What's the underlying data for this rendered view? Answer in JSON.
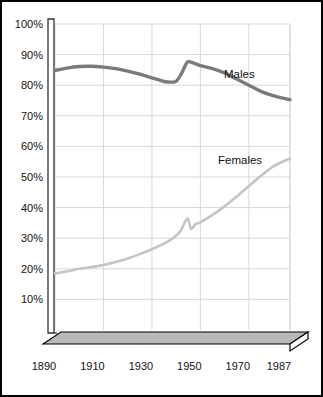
{
  "chart_data": {
    "type": "line",
    "title": "",
    "subtitle": "",
    "xlabel": "",
    "ylabel": "",
    "xlim": [
      1890,
      1987
    ],
    "ylim": [
      0,
      100
    ],
    "grid": true,
    "legend_position": "inline-right",
    "y_tick_labels": [
      "100%",
      "90%",
      "80%",
      "70%",
      "60%",
      "50%",
      "40%",
      "30%",
      "20%",
      "10%"
    ],
    "y_ticks": [
      100,
      90,
      80,
      70,
      60,
      50,
      40,
      30,
      20,
      10
    ],
    "x_tick_labels": [
      "1890",
      "1910",
      "1930",
      "1950",
      "1970",
      "1987"
    ],
    "x_ticks": [
      1890,
      1910,
      1930,
      1950,
      1970,
      1987
    ],
    "series": [
      {
        "name": "Males",
        "color": "#7a7a7a",
        "label": "Males",
        "x": [
          1890,
          1895,
          1900,
          1905,
          1910,
          1915,
          1920,
          1925,
          1930,
          1935,
          1938,
          1940,
          1942,
          1944,
          1945,
          1947,
          1950,
          1955,
          1960,
          1965,
          1970,
          1975,
          1980,
          1985,
          1987
        ],
        "values": [
          84.8,
          85.6,
          86.1,
          86.2,
          85.9,
          85.4,
          84.6,
          83.6,
          82.4,
          81.2,
          81.0,
          81.3,
          83.5,
          86.8,
          87.7,
          87.3,
          86.4,
          85.4,
          84.0,
          82.0,
          80.0,
          78.0,
          76.6,
          75.6,
          75.3
        ]
      },
      {
        "name": "Females",
        "color": "#c4c4c4",
        "label": "Females",
        "x": [
          1890,
          1895,
          1900,
          1905,
          1910,
          1915,
          1920,
          1925,
          1930,
          1935,
          1938,
          1940,
          1942,
          1944,
          1945,
          1946,
          1947,
          1948,
          1950,
          1955,
          1960,
          1965,
          1970,
          1975,
          1980,
          1985,
          1987
        ],
        "values": [
          18.5,
          19.2,
          20.0,
          20.6,
          21.2,
          22.2,
          23.4,
          24.8,
          26.4,
          28.2,
          29.6,
          30.8,
          32.6,
          35.8,
          36.2,
          33.2,
          33.6,
          34.6,
          35.2,
          37.6,
          40.4,
          43.6,
          47.0,
          50.4,
          53.4,
          55.4,
          56.0
        ]
      }
    ]
  },
  "axis_labels": {
    "y": [
      "100%",
      "90%",
      "80%",
      "70%",
      "60%",
      "50%",
      "40%",
      "30%",
      "20%",
      "10%"
    ],
    "x": [
      "1890",
      "1910",
      "1930",
      "1950",
      "1970",
      "1987"
    ]
  },
  "series_annotations": {
    "males": "Males",
    "females": "Females"
  },
  "colors": {
    "males_line": "#7a7a7a",
    "females_line": "#c4c4c4",
    "gridline": "#d8d8d8",
    "axis": "#333333",
    "base_plate": "#b9b9b9",
    "frame": "#000000",
    "text": "#111111"
  }
}
